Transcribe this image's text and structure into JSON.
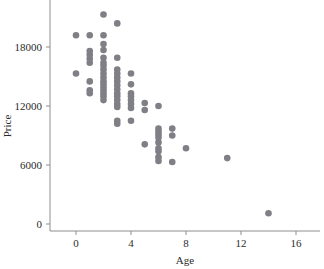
{
  "chart_data": {
    "type": "scatter",
    "title": "",
    "subtitle": "",
    "xlabel": "Age",
    "ylabel": "Price",
    "xlim": [
      -1.6,
      18.0
    ],
    "ylim": [
      -1100,
      22400
    ],
    "xticks": [
      0,
      4,
      8,
      12,
      16
    ],
    "xticklabels": [
      "0",
      "4",
      "8",
      "12",
      "16"
    ],
    "yticks": [
      0,
      6000,
      12000,
      18000
    ],
    "yticklabels": [
      "0",
      "6000",
      "12000",
      "18000"
    ],
    "grid": false,
    "legend": false,
    "marker": "circle",
    "marker_color": "#7f7f86",
    "marker_size": 4.6,
    "series": [
      {
        "name": "vehicles",
        "x": [
          0,
          0,
          1,
          1,
          1,
          1,
          1,
          1,
          1,
          1,
          2,
          2,
          2,
          2,
          2,
          2,
          2,
          2,
          2,
          2,
          2,
          2,
          2,
          2,
          2,
          2,
          2,
          3,
          3,
          3,
          3,
          3,
          3,
          3,
          3,
          3,
          3,
          3,
          3,
          3,
          3,
          3,
          4,
          4,
          4,
          4,
          4,
          4,
          4,
          4,
          5,
          5,
          5,
          6,
          6,
          6,
          6,
          6,
          6,
          6,
          6,
          6,
          6,
          7,
          7,
          7,
          8,
          11,
          14
        ],
        "y": [
          19200,
          15300,
          19200,
          17600,
          17200,
          16800,
          16400,
          14500,
          13600,
          13300,
          21300,
          19200,
          18300,
          17700,
          16900,
          16400,
          16100,
          15700,
          15300,
          14900,
          14500,
          14200,
          13900,
          13600,
          13300,
          13000,
          12600,
          20400,
          16900,
          15700,
          15300,
          14900,
          14500,
          14100,
          13700,
          13300,
          13000,
          12600,
          12200,
          11900,
          10500,
          10200,
          15300,
          14200,
          13300,
          13000,
          12600,
          12200,
          11800,
          10500,
          12300,
          11600,
          8100,
          12000,
          9700,
          9400,
          9100,
          8800,
          8300,
          7700,
          7400,
          6800,
          6400,
          9700,
          9000,
          6300,
          7700,
          6700,
          1100
        ]
      }
    ]
  },
  "axes": {
    "y_title": "Price",
    "x_title": "Age"
  }
}
